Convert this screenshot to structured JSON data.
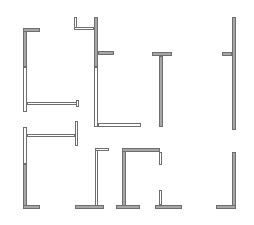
{
  "diagram": {
    "title": "",
    "colors": {
      "background": "#ffffff",
      "solid_fill": "#a6a6a6",
      "outline": "#6e6e6e",
      "hollow_fill": "#ffffff"
    },
    "shapes": [
      {
        "id": "shape-1",
        "label": "L-profile tall, left",
        "rects": [
          {
            "x": 23,
            "y": 28,
            "w": 4,
            "h": 39,
            "kind": "solid"
          },
          {
            "x": 23,
            "y": 28,
            "w": 17,
            "h": 4,
            "kind": "solid"
          },
          {
            "x": 23,
            "y": 67,
            "w": 4,
            "h": 45,
            "kind": "hollow"
          },
          {
            "x": 27,
            "y": 102,
            "w": 52,
            "h": 3,
            "kind": "hollow"
          },
          {
            "x": 76,
            "y": 100,
            "w": 3,
            "h": 7,
            "kind": "hollow"
          }
        ]
      },
      {
        "id": "shape-2",
        "label": "T-profile with hook, center-left",
        "rects": [
          {
            "x": 74,
            "y": 17,
            "w": 3,
            "h": 13,
            "kind": "hollow"
          },
          {
            "x": 74,
            "y": 27,
            "w": 20,
            "h": 3,
            "kind": "hollow"
          },
          {
            "x": 94,
            "y": 17,
            "w": 4,
            "h": 50,
            "kind": "solid"
          },
          {
            "x": 98,
            "y": 51,
            "w": 16,
            "h": 4,
            "kind": "solid"
          },
          {
            "x": 94,
            "y": 67,
            "w": 4,
            "h": 60,
            "kind": "hollow"
          },
          {
            "x": 98,
            "y": 123,
            "w": 43,
            "h": 4,
            "kind": "hollow"
          }
        ]
      },
      {
        "id": "shape-3",
        "label": "T-profile, center",
        "rects": [
          {
            "x": 152,
            "y": 52,
            "w": 20,
            "h": 4,
            "kind": "solid"
          },
          {
            "x": 159,
            "y": 56,
            "w": 4,
            "h": 71,
            "kind": "solid"
          }
        ]
      },
      {
        "id": "shape-4",
        "label": "Vertical bar with stub, right",
        "rects": [
          {
            "x": 232,
            "y": 17,
            "w": 4,
            "h": 113,
            "kind": "solid"
          },
          {
            "x": 222,
            "y": 52,
            "w": 10,
            "h": 4,
            "kind": "solid"
          }
        ]
      },
      {
        "id": "shape-5",
        "label": "C-profile with bracket, lower-left",
        "rects": [
          {
            "x": 23,
            "y": 127,
            "w": 4,
            "h": 37,
            "kind": "hollow"
          },
          {
            "x": 27,
            "y": 134,
            "w": 48,
            "h": 3,
            "kind": "hollow"
          },
          {
            "x": 75,
            "y": 121,
            "w": 3,
            "h": 25,
            "kind": "hollow"
          },
          {
            "x": 23,
            "y": 164,
            "w": 4,
            "h": 45,
            "kind": "solid"
          },
          {
            "x": 23,
            "y": 205,
            "w": 17,
            "h": 4,
            "kind": "solid"
          }
        ]
      },
      {
        "id": "shape-6",
        "label": "Inverted-T with hollow stem",
        "rects": [
          {
            "x": 95,
            "y": 148,
            "w": 3,
            "h": 58,
            "kind": "hollow"
          },
          {
            "x": 95,
            "y": 148,
            "w": 14,
            "h": 3,
            "kind": "hollow"
          },
          {
            "x": 75,
            "y": 205,
            "w": 29,
            "h": 4,
            "kind": "solid"
          }
        ]
      },
      {
        "id": "shape-7",
        "label": "Frame with gap, center-bottom",
        "rects": [
          {
            "x": 122,
            "y": 148,
            "w": 4,
            "h": 58,
            "kind": "solid"
          },
          {
            "x": 122,
            "y": 148,
            "w": 38,
            "h": 4,
            "kind": "solid"
          },
          {
            "x": 159,
            "y": 152,
            "w": 3,
            "h": 13,
            "kind": "hollow"
          },
          {
            "x": 116,
            "y": 205,
            "w": 24,
            "h": 4,
            "kind": "solid"
          },
          {
            "x": 159,
            "y": 190,
            "w": 3,
            "h": 15,
            "kind": "hollow"
          },
          {
            "x": 155,
            "y": 205,
            "w": 27,
            "h": 4,
            "kind": "solid"
          }
        ]
      },
      {
        "id": "shape-8",
        "label": "L-profile, lower-right",
        "rects": [
          {
            "x": 232,
            "y": 152,
            "w": 4,
            "h": 57,
            "kind": "solid"
          },
          {
            "x": 216,
            "y": 205,
            "w": 20,
            "h": 4,
            "kind": "solid"
          }
        ]
      }
    ]
  }
}
